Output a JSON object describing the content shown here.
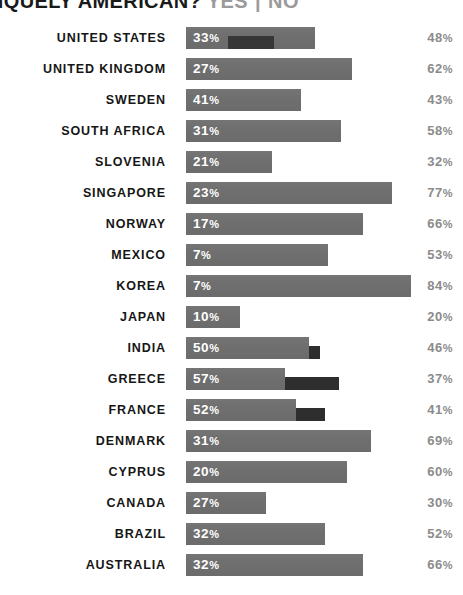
{
  "chart_data": {
    "type": "bar",
    "title": "LY UNIQUELY AMERICAN?",
    "title_full": "LY UNIQUELY AMERICAN? YES | NO",
    "title_separator": "|",
    "legend": [
      "YES",
      "NO"
    ],
    "legend_position": "title-right",
    "orientation": "horizontal",
    "xlabel": "",
    "ylabel": "",
    "xlim": [
      0,
      100
    ],
    "grid": false,
    "percent_symbol": "%",
    "categories": [
      "UNITED STATES",
      "UNITED KINGDOM",
      "SWEDEN",
      "SOUTH AFRICA",
      "SLOVENIA",
      "SINGAPORE",
      "NORWAY",
      "MEXICO",
      "KOREA",
      "JAPAN",
      "INDIA",
      "GREECE",
      "FRANCE",
      "DENMARK",
      "CYPRUS",
      "CANADA",
      "BRAZIL",
      "AUSTRALIA"
    ],
    "series": [
      {
        "name": "YES",
        "color": "#2e2e2e",
        "values": [
          33,
          27,
          41,
          31,
          21,
          23,
          17,
          7,
          7,
          10,
          50,
          57,
          52,
          31,
          20,
          27,
          32,
          32
        ]
      },
      {
        "name": "NO",
        "color": "#6f6f6f",
        "values": [
          48,
          62,
          43,
          58,
          32,
          77,
          66,
          53,
          84,
          20,
          46,
          37,
          41,
          69,
          60,
          30,
          52,
          66
        ]
      }
    ],
    "rows": [
      {
        "label": "UNITED STATES",
        "yes": 33,
        "yes_text": "33",
        "no": 48,
        "no_text": "48"
      },
      {
        "label": "UNITED KINGDOM",
        "yes": 27,
        "yes_text": "27",
        "no": 62,
        "no_text": "62"
      },
      {
        "label": "SWEDEN",
        "yes": 41,
        "yes_text": "41",
        "no": 43,
        "no_text": "43"
      },
      {
        "label": "SOUTH AFRICA",
        "yes": 31,
        "yes_text": "31",
        "no": 58,
        "no_text": "58"
      },
      {
        "label": "SLOVENIA",
        "yes": 21,
        "yes_text": "21",
        "no": 32,
        "no_text": "32"
      },
      {
        "label": "SINGAPORE",
        "yes": 23,
        "yes_text": "23",
        "no": 77,
        "no_text": "77"
      },
      {
        "label": "NORWAY",
        "yes": 17,
        "yes_text": "17",
        "no": 66,
        "no_text": "66"
      },
      {
        "label": "MEXICO",
        "yes": 7,
        "yes_text": "7",
        "no": 53,
        "no_text": "53"
      },
      {
        "label": "KOREA",
        "yes": 7,
        "yes_text": "7",
        "no": 84,
        "no_text": "84"
      },
      {
        "label": "JAPAN",
        "yes": 10,
        "yes_text": "10",
        "no": 20,
        "no_text": "20"
      },
      {
        "label": "INDIA",
        "yes": 50,
        "yes_text": "50",
        "no": 46,
        "no_text": "46"
      },
      {
        "label": "GREECE",
        "yes": 57,
        "yes_text": "57",
        "no": 37,
        "no_text": "37"
      },
      {
        "label": "FRANCE",
        "yes": 52,
        "yes_text": "52",
        "no": 41,
        "no_text": "41"
      },
      {
        "label": "DENMARK",
        "yes": 31,
        "yes_text": "31",
        "no": 69,
        "no_text": "69"
      },
      {
        "label": "CYPRUS",
        "yes": 20,
        "yes_text": "20",
        "no": 60,
        "no_text": "60"
      },
      {
        "label": "CANADA",
        "yes": 27,
        "yes_text": "27",
        "no": 30,
        "no_text": "30"
      },
      {
        "label": "BRAZIL",
        "yes": 32,
        "yes_text": "32",
        "no": 52,
        "no_text": "52"
      },
      {
        "label": "AUSTRALIA",
        "yes": 32,
        "yes_text": "32",
        "no": 66,
        "no_text": "66"
      }
    ]
  },
  "colors": {
    "background": "#ffffff",
    "bar_no": "#6f6f6f",
    "bar_yes": "#2e2e2e",
    "label_text": "#161616",
    "value_text_inside": "#ffffff",
    "value_text_right": "#8b8b8b",
    "title_text": "#1a1a1a",
    "title_legend_text": "#9a9a9a"
  }
}
